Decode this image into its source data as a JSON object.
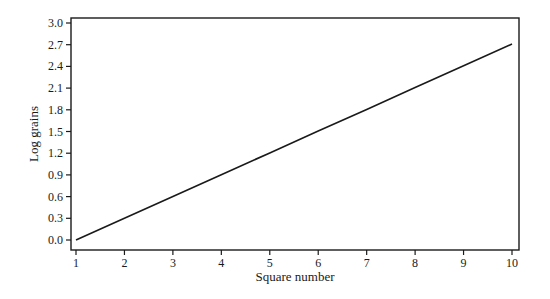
{
  "chart_data": {
    "type": "line",
    "title": "",
    "xlabel": "Square number",
    "ylabel": "Log grains",
    "x": [
      1,
      2,
      3,
      4,
      5,
      6,
      7,
      8,
      9,
      10
    ],
    "series": [
      {
        "name": "Log grains",
        "values": [
          0.0,
          0.301,
          0.602,
          0.903,
          1.204,
          1.505,
          1.806,
          2.107,
          2.408,
          2.709
        ]
      }
    ],
    "xticks": [
      "1",
      "2",
      "3",
      "4",
      "5",
      "6",
      "7",
      "8",
      "9",
      "10"
    ],
    "yticks": [
      "0.0",
      "0.3",
      "0.6",
      "0.9",
      "1.2",
      "1.5",
      "1.8",
      "2.1",
      "2.4",
      "2.7",
      "3.0"
    ],
    "xlim": [
      1,
      10
    ],
    "ylim": [
      0,
      3.0
    ],
    "grid": false,
    "legend": "none",
    "colors": {
      "line": "#1a1a1a",
      "frame": "#1a1a1a",
      "background": "#ffffff"
    }
  }
}
